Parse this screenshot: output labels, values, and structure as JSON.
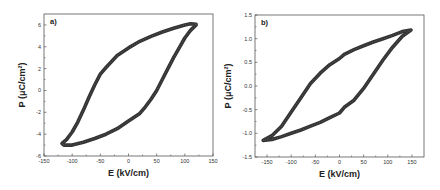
{
  "chart_data": [
    {
      "type": "scatter",
      "panel_label": "a)",
      "title": "",
      "xlabel": "E (kV/cm)",
      "ylabel": "P (μC/cm²)",
      "xlim": [
        -150,
        150
      ],
      "ylim": [
        -6,
        7
      ],
      "xticks": [
        -150,
        -100,
        -50,
        0,
        50,
        100,
        150
      ],
      "yticks": [
        -6,
        -4,
        -2,
        0,
        2,
        4,
        6
      ],
      "grid": false,
      "legend": null,
      "marker_color": "#333333",
      "series": [
        {
          "name": "hysteresis loop",
          "points": [
            [
              120,
              6.05
            ],
            [
              110,
              6.1
            ],
            [
              100,
              6.0
            ],
            [
              80,
              5.7
            ],
            [
              60,
              5.35
            ],
            [
              40,
              4.95
            ],
            [
              20,
              4.5
            ],
            [
              0,
              3.9
            ],
            [
              -20,
              3.2
            ],
            [
              -40,
              2.1
            ],
            [
              -50,
              1.5
            ],
            [
              -60,
              0.5
            ],
            [
              -70,
              -0.6
            ],
            [
              -80,
              -1.8
            ],
            [
              -90,
              -2.9
            ],
            [
              -100,
              -3.8
            ],
            [
              -110,
              -4.5
            ],
            [
              -118,
              -4.85
            ],
            [
              -115,
              -5.0
            ],
            [
              -100,
              -5.0
            ],
            [
              -80,
              -4.75
            ],
            [
              -60,
              -4.4
            ],
            [
              -40,
              -4.0
            ],
            [
              -20,
              -3.5
            ],
            [
              0,
              -2.8
            ],
            [
              20,
              -2.1
            ],
            [
              30,
              -1.5
            ],
            [
              40,
              -0.8
            ],
            [
              50,
              0.0
            ],
            [
              60,
              1.0
            ],
            [
              70,
              2.0
            ],
            [
              80,
              3.0
            ],
            [
              90,
              3.9
            ],
            [
              100,
              4.8
            ],
            [
              110,
              5.5
            ],
            [
              120,
              6.0
            ]
          ]
        }
      ]
    },
    {
      "type": "scatter",
      "panel_label": "b)",
      "title": "",
      "xlabel": "E (kV/cm)",
      "ylabel": "P (μC/cm²)",
      "xlim": [
        -175,
        175
      ],
      "ylim": [
        -1.5,
        1.5
      ],
      "xticks": [
        -150,
        -100,
        -50,
        0,
        50,
        100,
        150
      ],
      "yticks": [
        -1.5,
        -1.0,
        -0.5,
        0.0,
        0.5,
        1.0,
        1.5
      ],
      "grid": false,
      "legend": null,
      "marker_color": "#333333",
      "series": [
        {
          "name": "hysteresis loop",
          "points": [
            [
              148,
              1.18
            ],
            [
              130,
              1.15
            ],
            [
              110,
              1.07
            ],
            [
              90,
              1.0
            ],
            [
              70,
              0.93
            ],
            [
              50,
              0.85
            ],
            [
              30,
              0.77
            ],
            [
              10,
              0.67
            ],
            [
              0,
              0.58
            ],
            [
              -20,
              0.45
            ],
            [
              -40,
              0.27
            ],
            [
              -60,
              0.05
            ],
            [
              -80,
              -0.25
            ],
            [
              -100,
              -0.55
            ],
            [
              -120,
              -0.85
            ],
            [
              -140,
              -1.05
            ],
            [
              -158,
              -1.15
            ],
            [
              -140,
              -1.13
            ],
            [
              -120,
              -1.07
            ],
            [
              -100,
              -1.0
            ],
            [
              -80,
              -0.93
            ],
            [
              -60,
              -0.85
            ],
            [
              -40,
              -0.77
            ],
            [
              -20,
              -0.67
            ],
            [
              0,
              -0.57
            ],
            [
              10,
              -0.45
            ],
            [
              30,
              -0.3
            ],
            [
              50,
              -0.05
            ],
            [
              70,
              0.25
            ],
            [
              90,
              0.55
            ],
            [
              110,
              0.82
            ],
            [
              130,
              1.05
            ],
            [
              148,
              1.18
            ]
          ]
        }
      ]
    }
  ]
}
